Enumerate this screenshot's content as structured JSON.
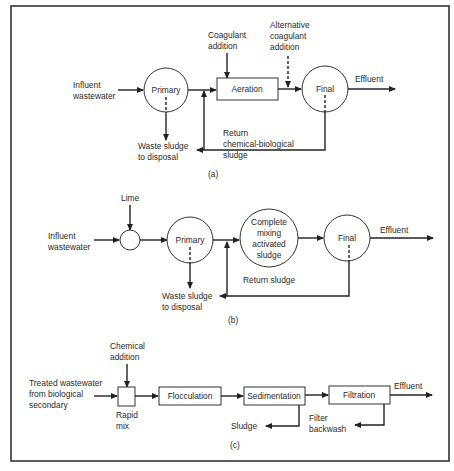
{
  "figure": {
    "panels": [
      {
        "id": "a",
        "caption": "(a)",
        "labels": {
          "influent": [
            "Influent",
            "wastewater"
          ],
          "coagulant": [
            "Coagulant",
            "addition"
          ],
          "alt_coagulant": [
            "Alternative",
            "coagulant",
            "addition"
          ],
          "effluent": "Effluent",
          "waste": [
            "Waste sludge",
            "to disposal"
          ],
          "return": [
            "Return",
            "chemical-biological",
            "sludge"
          ]
        },
        "nodes": {
          "primary": "Primary",
          "aeration": "Aeration",
          "final": "Final"
        }
      },
      {
        "id": "b",
        "caption": "(b)",
        "labels": {
          "lime": "Lime",
          "influent": [
            "Influent",
            "wastewater"
          ],
          "effluent": "Effluent",
          "waste": [
            "Waste sludge",
            "to disposal"
          ],
          "return": "Return sludge"
        },
        "nodes": {
          "primary": "Primary",
          "activated": [
            "Complete",
            "mixing",
            "activated",
            "sludge"
          ],
          "final": "Final"
        }
      },
      {
        "id": "c",
        "caption": "(c)",
        "labels": {
          "chemical": [
            "Chemical",
            "addition"
          ],
          "treated": [
            "Treated wastewater",
            "from biological",
            "secondary"
          ],
          "rapid_mix": [
            "Rapid",
            "mix"
          ],
          "effluent": "Effluent",
          "sludge": "Sludge",
          "backwash": [
            "Filter",
            "backwash"
          ]
        },
        "nodes": {
          "flocculation": "Flocculation",
          "sedimentation": "Sedimentation",
          "filtration": "Filtration"
        }
      }
    ]
  }
}
